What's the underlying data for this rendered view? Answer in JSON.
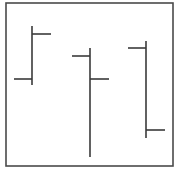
{
  "chart_data": {
    "type": "ohlc",
    "title": "",
    "xlabel": "",
    "ylabel": "",
    "axes_visible": false,
    "grid": false,
    "legend": null,
    "ylim": [
      0,
      170
    ],
    "categories": [
      "1",
      "2",
      "3"
    ],
    "series": [
      {
        "name": "bars",
        "ohlc": [
          {
            "open": 91,
            "high": 144,
            "low": 85,
            "close": 136
          },
          {
            "open": 114,
            "high": 122,
            "low": 13,
            "close": 91
          },
          {
            "open": 122,
            "high": 129,
            "low": 32,
            "close": 40
          }
        ]
      }
    ]
  },
  "layout": {
    "frame": {
      "x": 6,
      "y": 3,
      "w": 167,
      "h": 163
    },
    "bar_x": [
      32,
      90,
      146
    ],
    "tick_left_len": 18,
    "tick_right_len": 19,
    "y_base": 170
  },
  "colors": {
    "line": "#3a3a3a",
    "frame": "#4a4a4a",
    "background": "#ffffff"
  }
}
